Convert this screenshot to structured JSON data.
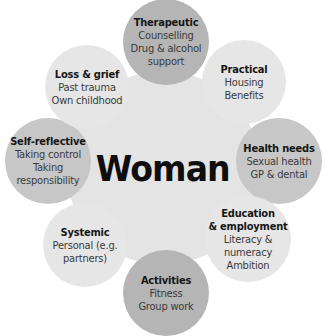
{
  "diagram": {
    "type": "radial-hub",
    "center": {
      "label": "Woman"
    },
    "nodes": [
      {
        "id": "therapeutic",
        "heading": "Therapeutic",
        "lines": [
          "Counselling",
          "Drug & alcohol",
          "support"
        ],
        "shade": "#b5b5b5"
      },
      {
        "id": "practical",
        "heading": "Practical",
        "lines": [
          "Housing",
          "Benefits"
        ],
        "shade": "#e6e6e6"
      },
      {
        "id": "health-needs",
        "heading": "Health needs",
        "lines": [
          "Sexual health",
          "GP & dental"
        ],
        "shade": "#c7c7c7"
      },
      {
        "id": "education-employment",
        "heading": "Education",
        "heading2": "& employment",
        "lines": [
          "Literacy &",
          "numeracy",
          "Ambition"
        ],
        "shade": "#e6e6e6"
      },
      {
        "id": "activities",
        "heading": "Activities",
        "lines": [
          "Fitness",
          "Group work"
        ],
        "shade": "#b5b5b5"
      },
      {
        "id": "systemic",
        "heading": "Systemic",
        "lines": [
          "Personal (e.g.",
          "partners)"
        ],
        "shade": "#e6e6e6"
      },
      {
        "id": "self-reflective",
        "heading": "Self-reflective",
        "lines": [
          "Taking control",
          "Taking",
          "responsibility"
        ],
        "shade": "#c7c7c7"
      },
      {
        "id": "loss-grief",
        "heading": "Loss & grief",
        "lines": [
          "Past trauma",
          "Own childhood"
        ],
        "shade": "#e6e6e6"
      }
    ]
  }
}
